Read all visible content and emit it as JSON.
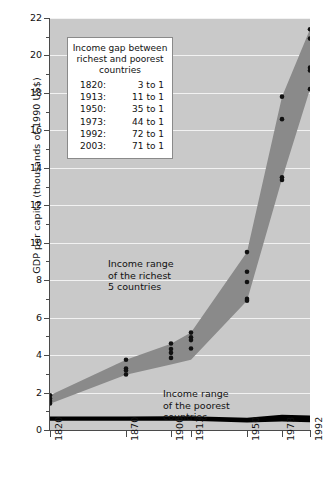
{
  "chart_data": {
    "type": "area",
    "title": "",
    "xlabel": "",
    "ylabel": "GDP per capita (thousands of 1990 US$)",
    "ylim": [
      0,
      22
    ],
    "yticks": [
      0,
      2,
      4,
      6,
      8,
      10,
      12,
      14,
      16,
      18,
      20,
      22
    ],
    "ytick_labels": [
      "0",
      "2",
      "4",
      "6",
      "8",
      "10",
      "12",
      "14",
      "16",
      "18",
      "20",
      "22"
    ],
    "yminor_step": 1,
    "grid": "horizontal",
    "legend_position": "inside-upper-left",
    "categories": [
      "1820",
      "1870",
      "1900",
      "1913",
      "1950",
      "1973",
      "1992"
    ],
    "x": [
      1820,
      1870,
      1900,
      1913,
      1950,
      1973,
      1992
    ],
    "x_pixel_positions": [
      0,
      76,
      121,
      141,
      197,
      232,
      260
    ],
    "series": [
      {
        "name": "Income range of the richest 5 countries (upper bound)",
        "values": [
          1.85,
          3.75,
          4.6,
          5.2,
          9.5,
          17.8,
          21.4
        ]
      },
      {
        "name": "Income range of the richest 5 countries (lower bound)",
        "values": [
          1.4,
          2.95,
          3.5,
          3.75,
          6.9,
          13.4,
          18.2
        ]
      },
      {
        "name": "Income range of the poorest countries (upper bound)",
        "values": [
          0.72,
          0.72,
          0.73,
          0.74,
          0.66,
          0.82,
          0.78
        ]
      },
      {
        "name": "Income range of the poorest countries (lower bound)",
        "values": [
          0.5,
          0.5,
          0.5,
          0.5,
          0.4,
          0.45,
          0.42
        ]
      }
    ],
    "scatter_points": [
      {
        "year": 1820,
        "values": [
          1.85,
          1.68,
          1.55,
          1.42
        ]
      },
      {
        "year": 1870,
        "values": [
          3.75,
          3.28,
          3.18,
          2.96
        ]
      },
      {
        "year": 1900,
        "values": [
          4.62,
          4.32,
          4.12,
          3.85
        ]
      },
      {
        "year": 1913,
        "values": [
          5.2,
          4.95,
          4.8,
          4.35
        ]
      },
      {
        "year": 1950,
        "values": [
          9.5,
          8.45,
          7.9,
          7.0,
          6.9
        ]
      },
      {
        "year": 1973,
        "values": [
          17.8,
          16.6,
          13.5,
          13.35
        ]
      },
      {
        "year": 1992,
        "values": [
          21.4,
          20.9,
          19.35,
          19.2,
          18.2
        ]
      }
    ],
    "annotations": [
      {
        "name": "richest-band-label",
        "text": "Income range\nof the richest\n5 countries"
      },
      {
        "name": "poorest-band-label",
        "text": "Income range\nof the poorest\ncountries"
      }
    ],
    "colors": {
      "plot_background": "#c9c9c9",
      "gridline": "#f2f2f2",
      "richest_band": "#8a8a8a",
      "poorest_band": "#000000",
      "point": "#111111",
      "axis": "#4a4a4a",
      "legend_background": "#ffffff",
      "legend_border": "#8a8a8a"
    }
  },
  "legend": {
    "title": "Income gap\nbetween richest and\npoorest countries",
    "rows": [
      {
        "year": "1820:",
        "ratio": "3 to 1"
      },
      {
        "year": "1913:",
        "ratio": "11 to 1"
      },
      {
        "year": "1950:",
        "ratio": "35 to 1"
      },
      {
        "year": "1973:",
        "ratio": "44 to 1"
      },
      {
        "year": "1992:",
        "ratio": "72 to 1"
      },
      {
        "year": "2003:",
        "ratio": "71 to 1"
      }
    ]
  }
}
